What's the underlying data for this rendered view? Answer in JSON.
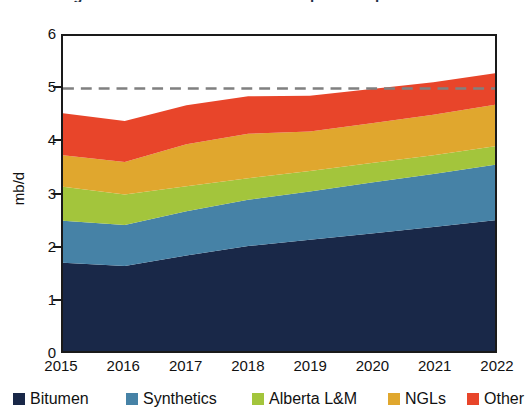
{
  "title": {
    "bullet": "bullet-icon",
    "text": "Figure 1: Canadian crude oil and equivalent production"
  },
  "chart_data": {
    "type": "area",
    "stacked": true,
    "title": "Figure 1: Canadian crude oil and equivalent production",
    "xlabel": "",
    "ylabel": "mb/d",
    "ylim": [
      0,
      6
    ],
    "yticks": [
      0,
      1,
      2,
      3,
      4,
      5,
      6
    ],
    "ytick_labels": [
      "0",
      "1",
      "2",
      "3",
      "4",
      "5",
      "6"
    ],
    "grid": false,
    "legend_position": "bottom",
    "x": [
      2015,
      2016,
      2017,
      2018,
      2019,
      2020,
      2021,
      2022
    ],
    "xtick_labels": [
      "2015",
      "2016",
      "2017",
      "2018",
      "2019",
      "2020",
      "2021",
      "2022"
    ],
    "series": [
      {
        "name": "Bitumen",
        "color": "#192848",
        "values": [
          1.68,
          1.62,
          1.82,
          2.0,
          2.12,
          2.24,
          2.36,
          2.49
        ]
      },
      {
        "name": "Synthetics",
        "color": "#4682a6",
        "values": [
          0.8,
          0.78,
          0.84,
          0.88,
          0.92,
          0.97,
          1.01,
          1.06
        ]
      },
      {
        "name": "Alberta L&M",
        "color": "#a3c53c",
        "values": [
          0.65,
          0.58,
          0.48,
          0.41,
          0.39,
          0.37,
          0.36,
          0.35
        ]
      },
      {
        "name": "NGLs",
        "color": "#e0a72e",
        "values": [
          0.6,
          0.62,
          0.8,
          0.85,
          0.75,
          0.76,
          0.77,
          0.79
        ]
      },
      {
        "name": "Other",
        "color": "#e8452a",
        "values": [
          0.8,
          0.78,
          0.74,
          0.71,
          0.68,
          0.65,
          0.62,
          0.6
        ]
      }
    ],
    "reference_line": {
      "value": 5.0,
      "style": "dashed",
      "color": "#808080",
      "label": ""
    }
  },
  "legend": {
    "items": [
      {
        "label": "Bitumen",
        "color": "#192848",
        "left": 13,
        "swatch": "legend-swatch-bitumen"
      },
      {
        "label": "Synthetics",
        "color": "#4682a6",
        "left": 126,
        "swatch": "legend-swatch-synthetics"
      },
      {
        "label": "Alberta L&M",
        "color": "#a3c53c",
        "left": 252,
        "swatch": "legend-swatch-alberta-lm"
      },
      {
        "label": "NGLs",
        "color": "#e0a72e",
        "left": 388,
        "swatch": "legend-swatch-ngls"
      },
      {
        "label": "Other",
        "color": "#e8452a",
        "left": 467,
        "swatch": "legend-swatch-other"
      }
    ]
  }
}
